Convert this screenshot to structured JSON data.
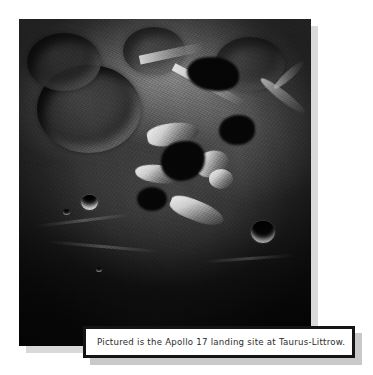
{
  "page": {
    "background_color": "#ffffff",
    "width": 373,
    "height": 375
  },
  "photo": {
    "name": "lunar-surface-photograph",
    "alt_description": "Black and white orbital photograph of the Moon's surface showing a large degraded crater at upper left, bright sunlit highland massifs and ridges through the center, deep black shadows, two sharp bowl-shaped craters, and dark smooth mare terrain across the lower portion.",
    "border_color": "#080808",
    "shadow_color": "#d9d9d9",
    "features": [
      {
        "label": "large-degraded-crater",
        "region": "upper-left"
      },
      {
        "label": "sunlit-massif-ridges",
        "region": "center"
      },
      {
        "label": "bowl-crater-left",
        "region": "mid-left"
      },
      {
        "label": "bowl-crater-right",
        "region": "mid-right"
      },
      {
        "label": "bright-curved-ridge",
        "region": "right-edge"
      },
      {
        "label": "dark-mare-plain",
        "region": "lower"
      }
    ]
  },
  "caption": {
    "text": "Pictured is the Apollo 17 landing site at Taurus-Littrow.",
    "border_color": "#141414",
    "background_color": "#ffffff",
    "text_color": "#2b2b2b",
    "shadow_color": "#c9c9c9"
  }
}
